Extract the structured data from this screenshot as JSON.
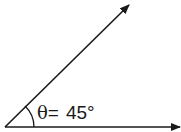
{
  "diagram": {
    "type": "angle",
    "angle_degrees": 45,
    "symbol": "θ",
    "equals": "=",
    "value_text": "45°",
    "rays": [
      {
        "name": "horizontal-ray",
        "direction_degrees": 0,
        "arrow": true
      },
      {
        "name": "inclined-ray",
        "direction_degrees": 45,
        "arrow": true
      }
    ],
    "stroke_color": "#1a1a1a",
    "background_color": "#ffffff"
  }
}
